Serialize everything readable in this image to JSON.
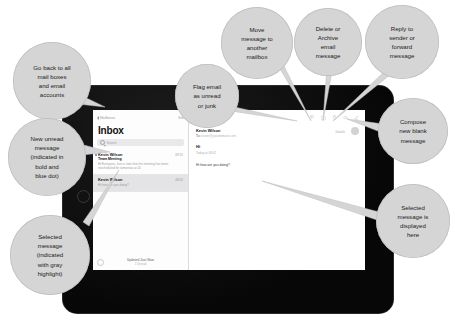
{
  "device": {
    "name": "tablet-ipad",
    "home_button": "home-button"
  },
  "mail_app": {
    "list": {
      "back_label": "Mailboxes",
      "edit_label": "Edit",
      "title": "Inbox",
      "search_placeholder": "Search",
      "messages": [
        {
          "from": "Kevin Wilson",
          "subject": "Team Meeting",
          "preview": "Hi Everyone, Just a note that the meeting has been rescheduled for tomorrow at 10",
          "time": "09:15",
          "unread": true,
          "selected": false
        },
        {
          "from": "Kevin Wilson",
          "subject": "",
          "preview": "Hi how are you doing?",
          "time": "08:42",
          "unread": false,
          "selected": true
        }
      ],
      "footer_status": "Updated Just Now",
      "footer_sub": "1 Unread"
    },
    "reader": {
      "toolbar_icons": [
        "flag-icon",
        "folder-move-icon",
        "trash-delete-icon",
        "reply-forward-icon",
        "compose-icon"
      ],
      "from_name": "Kevin Wilson",
      "to_label": "To:",
      "to_value": "kevin@yourdomain.com",
      "details_label": "Details",
      "avatar": "contact-avatar",
      "subject": "Hi",
      "date": "Today at 08:42",
      "body": "Hi how are you doing?"
    }
  },
  "callouts": [
    {
      "id": "callout-mailboxes",
      "lines": [
        "Go back to all",
        "mail boxes",
        "and email",
        "accounts"
      ]
    },
    {
      "id": "callout-unread",
      "lines": [
        "New unread",
        "message",
        "(indicated in",
        "bold and",
        "blue dot)"
      ]
    },
    {
      "id": "callout-selected-message",
      "lines": [
        "Selected",
        "message",
        "(indicated",
        "with gray",
        "highlight)"
      ]
    },
    {
      "id": "callout-flag",
      "lines": [
        "Flag email",
        "as unread",
        "or junk"
      ]
    },
    {
      "id": "callout-move",
      "lines": [
        "Move",
        "message to",
        "another",
        "mailbox"
      ]
    },
    {
      "id": "callout-delete",
      "lines": [
        "Delete or",
        "Archive",
        "email",
        "message"
      ]
    },
    {
      "id": "callout-reply",
      "lines": [
        "Reply to",
        "sender or",
        "forward",
        "message"
      ]
    },
    {
      "id": "callout-compose",
      "lines": [
        "Compose",
        "new blank",
        "message"
      ]
    },
    {
      "id": "callout-reading-pane",
      "lines": [
        "Selected",
        "message is",
        "displayed",
        "here"
      ]
    }
  ],
  "colors": {
    "callout_fill": "#d5d5d5",
    "callout_stroke": "#bdbdbd",
    "unread_dot": "#3478f6",
    "selected_row": "#e4e4e6",
    "device_frame": "#0b0b0b"
  }
}
